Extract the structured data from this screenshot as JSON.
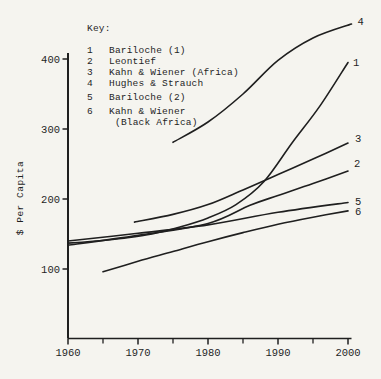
{
  "figure": {
    "background": "#f5f4ef",
    "ink_color": "#1f1f1f"
  },
  "chart_data": {
    "type": "line",
    "title": "",
    "xlabel": "",
    "ylabel": "$ Per Capita",
    "xlim": [
      1960,
      2000.6
    ],
    "ylim": [
      0,
      470
    ],
    "grid": false,
    "x_ticks_major": [
      1960,
      1970,
      1980,
      1990,
      2000
    ],
    "x_ticks_minor": [
      1965,
      1975,
      1985,
      1995
    ],
    "y_ticks": [
      100,
      200,
      300,
      400
    ],
    "legend_position": "upper-left-inside",
    "key": {
      "title": "Key:",
      "items": [
        {
          "num": "1",
          "label": "Bariloche (1)",
          "group2": false
        },
        {
          "num": "2",
          "label": "Leontief",
          "group2": false
        },
        {
          "num": "3",
          "label": "Kahn & Wiener (Africa)",
          "group2": false
        },
        {
          "num": "4",
          "label": "Hughes & Strauch",
          "group2": false
        },
        {
          "num": "5",
          "label": "Bariloche (2)",
          "group2": true
        },
        {
          "num": "6",
          "label": "Kahn & Wiener",
          "sublabel": "(Black Africa)",
          "group2": true
        }
      ]
    },
    "series": [
      {
        "id": "bariloche-1",
        "name": "Bariloche (1)",
        "end_label": "1",
        "points": [
          [
            1960,
            137
          ],
          [
            1964,
            140
          ],
          [
            1968,
            144
          ],
          [
            1972,
            150
          ],
          [
            1976,
            160
          ],
          [
            1980,
            173
          ],
          [
            1984,
            192
          ],
          [
            1988,
            225
          ],
          [
            1992,
            280
          ],
          [
            1996,
            333
          ],
          [
            2000,
            395
          ]
        ],
        "label_dx": 5,
        "label_dy": 0
      },
      {
        "id": "leontief",
        "name": "Leontief",
        "end_label": "2",
        "points": [
          [
            1960,
            134
          ],
          [
            1970,
            148
          ],
          [
            1980,
            165
          ],
          [
            1986,
            191
          ],
          [
            1990,
            205
          ],
          [
            1995,
            222
          ],
          [
            2000,
            240
          ]
        ],
        "label_dx": 6,
        "label_dy": -8
      },
      {
        "id": "kahn-wiener-africa",
        "name": "Kahn & Wiener (Africa)",
        "end_label": "3",
        "points": [
          [
            1969.5,
            167
          ],
          [
            1975,
            178
          ],
          [
            1980,
            192
          ],
          [
            1985,
            213
          ],
          [
            1990,
            235
          ],
          [
            1995,
            257
          ],
          [
            2000,
            280
          ]
        ],
        "label_dx": 7,
        "label_dy": -5
      },
      {
        "id": "hughes-strauch",
        "name": "Hughes & Strauch",
        "end_label": "4",
        "points": [
          [
            1975,
            281
          ],
          [
            1980,
            310
          ],
          [
            1985,
            350
          ],
          [
            1990,
            398
          ],
          [
            1995,
            430
          ],
          [
            2000.5,
            450
          ]
        ],
        "label_dx": 6,
        "label_dy": -3
      },
      {
        "id": "bariloche-2",
        "name": "Bariloche (2)",
        "end_label": "5",
        "points": [
          [
            1960,
            140
          ],
          [
            1970,
            151
          ],
          [
            1980,
            163
          ],
          [
            1990,
            181
          ],
          [
            2000,
            195
          ]
        ],
        "label_dx": 7,
        "label_dy": -1
      },
      {
        "id": "kahn-wiener-black-africa",
        "name": "Kahn & Wiener (Black Africa)",
        "end_label": "6",
        "points": [
          [
            1965,
            96
          ],
          [
            1970,
            111
          ],
          [
            1975,
            125
          ],
          [
            1980,
            139
          ],
          [
            1985,
            152
          ],
          [
            1990,
            164
          ],
          [
            1995,
            174
          ],
          [
            2000,
            183
          ]
        ],
        "label_dx": 7,
        "label_dy": 1
      }
    ]
  }
}
